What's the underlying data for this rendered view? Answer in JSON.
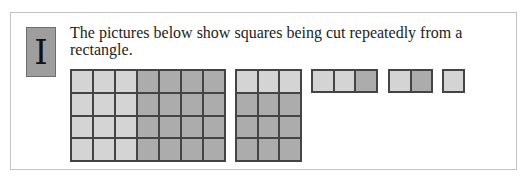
{
  "badge": {
    "letter": "I"
  },
  "instruction": "The pictures below show squares being cut repeatedly from a rectangle.",
  "colors": {
    "light_cell": "#d4d4d4",
    "dark_cell": "#acacac",
    "grid_line": "#444444",
    "badge_bg": "#9e9e9e"
  },
  "figures": [
    {
      "name": "rectangle-7x4",
      "cols": 7,
      "rows": 4,
      "light_cols": 3,
      "description": "7 by 4 rectangle, left 3 columns light, right 4x4 square dark"
    },
    {
      "name": "rectangle-3x4",
      "cols": 3,
      "rows": 4,
      "light_rows": 1,
      "description": "3 by 4 rectangle, top row light, bottom 3x3 square dark"
    },
    {
      "name": "rectangle-3x1",
      "cols": 3,
      "rows": 1,
      "light_cols": 2,
      "description": "3 by 1 strip, left 2 light, right 1 dark"
    },
    {
      "name": "rectangle-2x1",
      "cols": 2,
      "rows": 1,
      "light_cols": 1,
      "description": "2 by 1 strip, left light, right dark"
    },
    {
      "name": "square-1x1",
      "cols": 1,
      "rows": 1,
      "light_cols": 1,
      "description": "single light square"
    }
  ]
}
